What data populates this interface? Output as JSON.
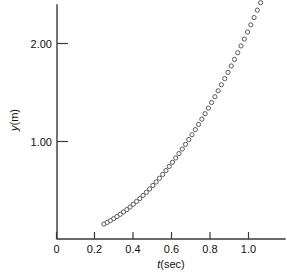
{
  "chart_data": {
    "type": "scatter",
    "title": "",
    "xlabel": "t(sec)",
    "ylabel": "y(m)",
    "xlim": [
      0.0,
      1.15
    ],
    "ylim": [
      0.0,
      2.45
    ],
    "grid": false,
    "legend": null,
    "marker": "open-circle",
    "xticks": [
      0,
      0.2,
      0.4,
      0.6,
      0.8,
      1.0
    ],
    "xtick_labels": [
      "0",
      "0.2",
      "0.4",
      "0.6",
      "0.8",
      "1.0"
    ],
    "yticks": [
      1.0,
      2.0
    ],
    "ytick_labels": [
      "1.00",
      "2.00"
    ],
    "series_name": "free-fall position",
    "x": [
      0.247,
      0.264,
      0.281,
      0.298,
      0.315,
      0.332,
      0.349,
      0.366,
      0.383,
      0.4,
      0.417,
      0.434,
      0.451,
      0.468,
      0.485,
      0.502,
      0.519,
      0.536,
      0.553,
      0.57,
      0.587,
      0.604,
      0.621,
      0.638,
      0.655,
      0.672,
      0.689,
      0.706,
      0.723,
      0.74,
      0.757,
      0.774,
      0.791,
      0.808,
      0.825,
      0.842,
      0.859,
      0.876,
      0.893,
      0.91,
      0.927,
      0.944,
      0.961,
      0.978,
      0.995,
      1.012,
      1.029,
      1.046,
      1.063
    ],
    "y": [
      0.153,
      0.17,
      0.189,
      0.209,
      0.23,
      0.253,
      0.277,
      0.302,
      0.328,
      0.356,
      0.385,
      0.415,
      0.447,
      0.479,
      0.513,
      0.549,
      0.585,
      0.623,
      0.662,
      0.702,
      0.744,
      0.787,
      0.831,
      0.876,
      0.923,
      0.971,
      1.02,
      1.07,
      1.122,
      1.175,
      1.229,
      1.285,
      1.342,
      1.4,
      1.459,
      1.52,
      1.582,
      1.645,
      1.709,
      1.775,
      1.842,
      1.91,
      1.98,
      2.051,
      2.123,
      2.196,
      2.271,
      2.347,
      2.424
    ]
  },
  "axis": {
    "y_label_text": "y(m)",
    "y_label_italic": "y",
    "y_label_rest": "(m)",
    "x_label_italic": "t",
    "x_label_rest": "(sec)"
  },
  "colors": {
    "axis": "#3a3a3a",
    "marker_stroke": "#5a5a5a",
    "marker_fill": "#ffffff",
    "background": "#ffffff",
    "text": "#111111"
  }
}
